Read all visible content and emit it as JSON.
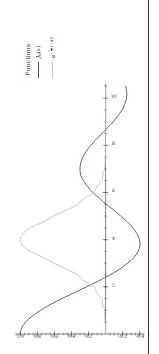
{
  "figure": {
    "legend": {
      "title": "Functions",
      "entries": [
        {
          "name": "bessel-j0",
          "label_plain": "J0(x)",
          "color": "#3c4a7a"
        },
        {
          "name": "gaussian",
          "label_plain": "e^(-1/2 (x-4)^2)",
          "color": "#c8bca4"
        }
      ]
    }
  },
  "chart_data": {
    "type": "line",
    "title": "",
    "xlabel": "",
    "ylabel": "",
    "xlim": [
      0,
      10.6
    ],
    "ylim": [
      -0.45,
      1.05
    ],
    "grid": false,
    "legend_position": "right",
    "legend_title": "Functions",
    "orientation": "rotated-90-ccw",
    "xticks": [
      2,
      4,
      6,
      8,
      10
    ],
    "xtick_labels": [
      "2",
      "4",
      "6",
      "8",
      "10"
    ],
    "yticks": [
      -0.4,
      -0.2,
      0.2,
      0.4,
      0.6,
      0.8,
      1.0
    ],
    "ytick_labels": [
      "-0.4",
      "-0.2",
      "0.2",
      "0.4",
      "0.6",
      "0.8",
      "1.0"
    ],
    "x": [
      0,
      0.25,
      0.5,
      0.75,
      1,
      1.25,
      1.5,
      1.75,
      2,
      2.25,
      2.5,
      2.75,
      3,
      3.25,
      3.5,
      3.75,
      4,
      4.25,
      4.5,
      4.75,
      5,
      5.25,
      5.5,
      5.75,
      6,
      6.25,
      6.5,
      6.75,
      7,
      7.25,
      7.5,
      7.75,
      8,
      8.25,
      8.5,
      8.75,
      9,
      9.25,
      9.5,
      9.75,
      10,
      10.25,
      10.5
    ],
    "series": [
      {
        "name": "J0(x)",
        "color": "#3c4a7a",
        "values": [
          1.0,
          0.9844,
          0.9385,
          0.8642,
          0.7652,
          0.6459,
          0.5118,
          0.369,
          0.2239,
          0.0827,
          -0.0484,
          -0.1641,
          -0.2601,
          -0.3332,
          -0.3801,
          -0.4026,
          -0.3971,
          -0.3679,
          -0.3205,
          -0.2579,
          -0.1776,
          -0.0968,
          -0.0068,
          0.0717,
          0.1506,
          0.2097,
          0.2601,
          0.2921,
          0.3001,
          0.2914,
          0.2663,
          0.2252,
          0.1717,
          0.1112,
          0.0419,
          -0.0226,
          -0.0903,
          -0.1424,
          -0.1939,
          -0.2243,
          -0.2459,
          -0.2473,
          -0.2366
        ]
      },
      {
        "name": "e^{-1/2 (x-4)^2}",
        "color": "#c8bca4",
        "values": [
          0.0003,
          0.0012,
          0.0043,
          0.0138,
          0.0111,
          0.034,
          0.0439,
          0.1054,
          0.1353,
          0.2516,
          0.3247,
          0.4578,
          0.6065,
          0.7316,
          0.8825,
          0.9692,
          1.0,
          0.9692,
          0.8825,
          0.7316,
          0.6065,
          0.4578,
          0.3247,
          0.2516,
          0.1353,
          0.1054,
          0.0439,
          0.034,
          0.0111,
          0.0068,
          0.0022,
          0.0012,
          0.0003,
          0.0001,
          0.0,
          0.0,
          0.0,
          0.0,
          0.0,
          0.0,
          0.0,
          0.0,
          0.0
        ]
      }
    ]
  }
}
